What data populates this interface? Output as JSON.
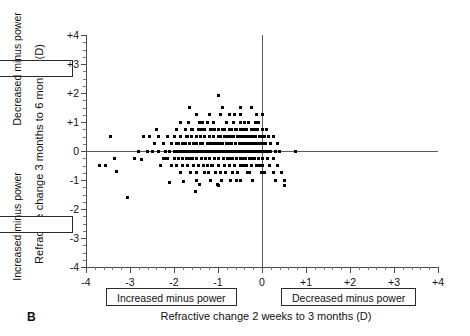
{
  "panel": {
    "letter": "B"
  },
  "axes": {
    "x_title": "Refractive change 2 weeks to 3 months (D)",
    "y_title": "Refractive change 3 months to 6 months (D)",
    "x_ticks": [
      "-4",
      "-3",
      "-2",
      "-1",
      "0",
      "+1",
      "+2",
      "+3",
      "+4"
    ],
    "x_tick_values": [
      -4,
      -3,
      -2,
      -1,
      0,
      1,
      2,
      3,
      4
    ],
    "y_ticks": [
      "+4",
      "+3",
      "+2",
      "+1",
      "0",
      "-1",
      "-2",
      "-3",
      "-4"
    ],
    "y_tick_values": [
      4,
      3,
      2,
      1,
      0,
      -1,
      -2,
      -3,
      -4
    ],
    "x_box_left": "Increased minus power",
    "x_box_right": "Decreased minus power",
    "y_box_top": "Decreased minus power",
    "y_box_bottom": "Increased minus power"
  },
  "chart_data": {
    "type": "scatter",
    "title": "",
    "xlabel": "Refractive change 2 weeks to 3 months (D)",
    "ylabel": "Refractive change 3 months to 6 months (D)",
    "xlim": [
      -4,
      4
    ],
    "ylim": [
      -4,
      4
    ],
    "xtick_step": 1,
    "xtick_minor_step": 0.2,
    "ytick_step": 1,
    "ytick_minor_step": 0.25,
    "grid": false,
    "legend": null,
    "marker": "square",
    "marker_color": "#000000",
    "marker_size_px": 3,
    "reference_lines": [
      {
        "orientation": "horizontal",
        "value": 0
      },
      {
        "orientation": "vertical",
        "value": 0
      }
    ],
    "annotations": [
      {
        "text": "Increased minus power",
        "axis": "x",
        "region": "negative"
      },
      {
        "text": "Decreased minus power",
        "axis": "x",
        "region": "positive"
      },
      {
        "text": "Decreased minus power",
        "axis": "y",
        "region": "positive"
      },
      {
        "text": "Increased minus power",
        "axis": "y",
        "region": "negative"
      }
    ],
    "n_points": 268,
    "points": [
      [
        -3.7,
        -0.5
      ],
      [
        -3.45,
        0.5
      ],
      [
        -3.35,
        -0.25
      ],
      [
        -3.3,
        -0.7
      ],
      [
        -3.05,
        -1.6
      ],
      [
        -2.8,
        0.0
      ],
      [
        -2.75,
        -0.3
      ],
      [
        -2.55,
        0.5
      ],
      [
        -2.5,
        0.0
      ],
      [
        -2.45,
        0.25
      ],
      [
        -2.4,
        0.75
      ],
      [
        -2.35,
        0.0
      ],
      [
        -2.3,
        -0.5
      ],
      [
        -2.25,
        0.25
      ],
      [
        -2.2,
        0.0
      ],
      [
        -2.2,
        -0.25
      ],
      [
        -2.15,
        0.5
      ],
      [
        -2.1,
        0.0
      ],
      [
        -2.1,
        -1.1
      ],
      [
        -2.05,
        0.25
      ],
      [
        -2.0,
        0.0
      ],
      [
        -2.0,
        -0.25
      ],
      [
        -2.0,
        0.5
      ],
      [
        -1.95,
        0.25
      ],
      [
        -1.95,
        0.0
      ],
      [
        -1.95,
        -0.5
      ],
      [
        -1.9,
        0.0
      ],
      [
        -1.9,
        0.25
      ],
      [
        -1.9,
        -0.25
      ],
      [
        -1.85,
        1.0
      ],
      [
        -1.85,
        0.5
      ],
      [
        -1.85,
        0.0
      ],
      [
        -1.8,
        0.25
      ],
      [
        -1.8,
        0.0
      ],
      [
        -1.8,
        -0.25
      ],
      [
        -1.8,
        -0.5
      ],
      [
        -1.78,
        -1.05
      ],
      [
        -1.75,
        0.75
      ],
      [
        -1.75,
        0.25
      ],
      [
        -1.75,
        0.0
      ],
      [
        -1.72,
        -0.25
      ],
      [
        -1.7,
        0.5
      ],
      [
        -1.7,
        0.0
      ],
      [
        -1.7,
        -0.5
      ],
      [
        -1.65,
        1.5
      ],
      [
        -1.65,
        0.25
      ],
      [
        -1.65,
        0.0
      ],
      [
        -1.65,
        -0.25
      ],
      [
        -1.62,
        -0.75
      ],
      [
        -1.6,
        0.75
      ],
      [
        -1.6,
        0.5
      ],
      [
        -1.6,
        0.0
      ],
      [
        -1.58,
        -0.25
      ],
      [
        -1.55,
        0.25
      ],
      [
        -1.55,
        0.0
      ],
      [
        -1.55,
        -0.5
      ],
      [
        -1.52,
        -1.4
      ],
      [
        -1.5,
        1.25
      ],
      [
        -1.5,
        0.5
      ],
      [
        -1.5,
        0.25
      ],
      [
        -1.5,
        0.0
      ],
      [
        -1.5,
        -0.25
      ],
      [
        -1.5,
        -0.75
      ],
      [
        -1.45,
        0.75
      ],
      [
        -1.45,
        0.0
      ],
      [
        -1.45,
        -0.5
      ],
      [
        -1.42,
        -1.15
      ],
      [
        -1.4,
        0.5
      ],
      [
        -1.4,
        0.25
      ],
      [
        -1.4,
        0.0
      ],
      [
        -1.38,
        -0.25
      ],
      [
        -1.35,
        1.0
      ],
      [
        -1.35,
        0.25
      ],
      [
        -1.35,
        0.0
      ],
      [
        -1.32,
        -0.5
      ],
      [
        -1.3,
        0.75
      ],
      [
        -1.3,
        0.5
      ],
      [
        -1.3,
        0.0
      ],
      [
        -1.28,
        -0.25
      ],
      [
        -1.25,
        0.25
      ],
      [
        -1.25,
        0.0
      ],
      [
        -1.25,
        -0.5
      ],
      [
        -1.22,
        -0.75
      ],
      [
        -1.2,
        1.25
      ],
      [
        -1.2,
        0.5
      ],
      [
        -1.2,
        0.25
      ],
      [
        -1.2,
        0.0
      ],
      [
        -1.2,
        -0.25
      ],
      [
        -1.18,
        -1.0
      ],
      [
        -1.15,
        0.75
      ],
      [
        -1.15,
        0.0
      ],
      [
        -1.15,
        -0.5
      ],
      [
        -1.12,
        0.25
      ],
      [
        -1.1,
        1.0
      ],
      [
        -1.1,
        0.5
      ],
      [
        -1.1,
        0.0
      ],
      [
        -1.08,
        -0.25
      ],
      [
        -1.05,
        0.25
      ],
      [
        -1.05,
        0.0
      ],
      [
        -1.05,
        -0.75
      ],
      [
        -1.02,
        -1.15
      ],
      [
        -1.0,
        1.9
      ],
      [
        -1.0,
        0.75
      ],
      [
        -1.0,
        0.5
      ],
      [
        -1.0,
        0.25
      ],
      [
        -1.0,
        0.0
      ],
      [
        -1.0,
        -0.25
      ],
      [
        -1.0,
        -0.5
      ],
      [
        -0.98,
        -1.2
      ],
      [
        -0.95,
        1.25
      ],
      [
        -0.95,
        0.5
      ],
      [
        -0.95,
        0.0
      ],
      [
        -0.92,
        0.25
      ],
      [
        -0.9,
        1.5
      ],
      [
        -0.9,
        0.75
      ],
      [
        -0.9,
        0.25
      ],
      [
        -0.9,
        0.0
      ],
      [
        -0.88,
        -0.25
      ],
      [
        -0.85,
        0.5
      ],
      [
        -0.85,
        0.0
      ],
      [
        -0.85,
        -0.5
      ],
      [
        -0.82,
        -0.75
      ],
      [
        -0.8,
        1.0
      ],
      [
        -0.8,
        0.25
      ],
      [
        -0.8,
        0.0
      ],
      [
        -0.78,
        -0.25
      ],
      [
        -0.75,
        1.25
      ],
      [
        -0.75,
        0.75
      ],
      [
        -0.75,
        0.5
      ],
      [
        -0.75,
        0.25
      ],
      [
        -0.75,
        0.0
      ],
      [
        -0.75,
        -0.25
      ],
      [
        -0.75,
        -0.5
      ],
      [
        -0.72,
        -1.0
      ],
      [
        -0.7,
        0.75
      ],
      [
        -0.7,
        0.25
      ],
      [
        -0.7,
        0.0
      ],
      [
        -0.68,
        -0.25
      ],
      [
        -0.65,
        1.0
      ],
      [
        -0.65,
        0.5
      ],
      [
        -0.65,
        0.0
      ],
      [
        -0.62,
        -0.5
      ],
      [
        -0.6,
        0.75
      ],
      [
        -0.6,
        0.25
      ],
      [
        -0.6,
        0.0
      ],
      [
        -0.58,
        -0.25
      ],
      [
        -0.55,
        0.5
      ],
      [
        -0.55,
        0.0
      ],
      [
        -0.55,
        -0.75
      ],
      [
        -0.52,
        0.25
      ],
      [
        -0.5,
        1.25
      ],
      [
        -0.5,
        1.0
      ],
      [
        -0.5,
        0.75
      ],
      [
        -0.5,
        0.5
      ],
      [
        -0.5,
        0.25
      ],
      [
        -0.5,
        0.0
      ],
      [
        -0.5,
        -0.25
      ],
      [
        -0.5,
        -0.5
      ],
      [
        -0.48,
        -1.0
      ],
      [
        -0.45,
        0.75
      ],
      [
        -0.45,
        0.25
      ],
      [
        -0.45,
        0.0
      ],
      [
        -0.45,
        -0.25
      ],
      [
        -0.42,
        0.5
      ],
      [
        -0.4,
        1.0
      ],
      [
        -0.4,
        0.5
      ],
      [
        -0.4,
        0.25
      ],
      [
        -0.4,
        0.0
      ],
      [
        -0.38,
        -0.25
      ],
      [
        -0.35,
        0.75
      ],
      [
        -0.35,
        0.25
      ],
      [
        -0.35,
        0.0
      ],
      [
        -0.35,
        -0.5
      ],
      [
        -0.32,
        -0.75
      ],
      [
        -0.3,
        1.0
      ],
      [
        -0.3,
        0.5
      ],
      [
        -0.3,
        0.25
      ],
      [
        -0.3,
        0.0
      ],
      [
        -0.28,
        -0.25
      ],
      [
        -0.25,
        1.5
      ],
      [
        -0.25,
        0.75
      ],
      [
        -0.25,
        0.5
      ],
      [
        -0.25,
        0.25
      ],
      [
        -0.25,
        0.0
      ],
      [
        -0.25,
        -0.25
      ],
      [
        -0.25,
        -0.5
      ],
      [
        -0.22,
        -1.0
      ],
      [
        -0.2,
        0.75
      ],
      [
        -0.2,
        0.25
      ],
      [
        -0.2,
        0.0
      ],
      [
        -0.18,
        -0.25
      ],
      [
        -0.15,
        1.0
      ],
      [
        -0.15,
        0.5
      ],
      [
        -0.15,
        0.25
      ],
      [
        -0.15,
        0.0
      ],
      [
        -0.12,
        -0.5
      ],
      [
        -0.1,
        0.75
      ],
      [
        -0.1,
        0.25
      ],
      [
        -0.1,
        0.0
      ],
      [
        -0.08,
        -0.25
      ],
      [
        -0.05,
        0.5
      ],
      [
        -0.05,
        0.25
      ],
      [
        -0.05,
        0.0
      ],
      [
        -0.05,
        -0.5
      ],
      [
        -0.02,
        -0.75
      ],
      [
        0.0,
        1.25
      ],
      [
        0.0,
        0.75
      ],
      [
        0.0,
        0.5
      ],
      [
        0.0,
        0.25
      ],
      [
        0.0,
        0.0
      ],
      [
        0.0,
        -0.25
      ],
      [
        0.0,
        -0.5
      ],
      [
        0.0,
        -0.75
      ],
      [
        0.05,
        0.5
      ],
      [
        0.05,
        0.0
      ],
      [
        0.08,
        0.25
      ],
      [
        0.1,
        0.75
      ],
      [
        0.1,
        0.0
      ],
      [
        0.12,
        -0.25
      ],
      [
        0.15,
        0.5
      ],
      [
        0.15,
        0.0
      ],
      [
        0.18,
        -0.5
      ],
      [
        0.2,
        0.25
      ],
      [
        0.2,
        0.0
      ],
      [
        0.25,
        0.5
      ],
      [
        0.25,
        -0.25
      ],
      [
        0.25,
        -0.75
      ],
      [
        0.3,
        0.0
      ],
      [
        0.3,
        -1.0
      ],
      [
        0.35,
        0.25
      ],
      [
        0.35,
        -0.5
      ],
      [
        0.4,
        0.0
      ],
      [
        0.45,
        -0.75
      ],
      [
        0.5,
        -1.0
      ],
      [
        0.5,
        -1.2
      ],
      [
        0.75,
        0.0
      ],
      [
        -2.6,
        0.0
      ],
      [
        -2.35,
        0.5
      ],
      [
        -2.9,
        -0.25
      ],
      [
        -1.95,
        0.75
      ],
      [
        -1.72,
        0.5
      ],
      [
        -1.48,
        -1.0
      ],
      [
        -1.3,
        -0.75
      ],
      [
        -1.12,
        -0.5
      ],
      [
        -0.95,
        -0.75
      ],
      [
        -0.85,
        0.75
      ],
      [
        -0.68,
        0.5
      ],
      [
        -0.58,
        0.75
      ],
      [
        -0.42,
        -0.5
      ],
      [
        -0.32,
        0.5
      ],
      [
        -0.22,
        0.5
      ],
      [
        -0.12,
        1.25
      ],
      [
        -2.05,
        -0.5
      ],
      [
        -1.85,
        -0.75
      ],
      [
        -1.68,
        1.0
      ],
      [
        -1.38,
        0.75
      ],
      [
        -1.18,
        0.75
      ],
      [
        -0.62,
        1.25
      ],
      [
        -0.48,
        1.5
      ],
      [
        -0.38,
        0.75
      ],
      [
        -1.25,
        1.0
      ],
      [
        -1.58,
        0.75
      ],
      [
        -2.15,
        -0.25
      ],
      [
        -0.92,
        -1.0
      ],
      [
        -1.48,
        0.5
      ],
      [
        -0.78,
        0.5
      ],
      [
        -0.58,
        -1.0
      ],
      [
        -0.68,
        -0.75
      ],
      [
        -1.08,
        0.75
      ],
      [
        -1.42,
        1.0
      ],
      [
        -2.25,
        -0.25
      ],
      [
        -0.28,
        -0.75
      ],
      [
        -0.18,
        0.75
      ],
      [
        -0.08,
        1.0
      ],
      [
        0.05,
        -0.75
      ],
      [
        -3.55,
        -0.5
      ],
      [
        -2.7,
        0.5
      ]
    ]
  }
}
